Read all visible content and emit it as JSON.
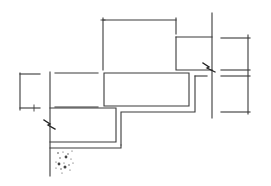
{
  "diagram": {
    "type": "architectural-section",
    "colors": {
      "line": "#3a3a3a",
      "background": "#ffffff",
      "stipple": "#444444"
    },
    "labels": []
  }
}
